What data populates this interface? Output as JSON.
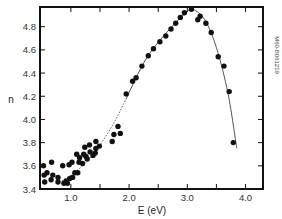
{
  "chart_data": {
    "type": "scatter",
    "title": "",
    "xlabel": "E (eV)",
    "ylabel": "n",
    "xlim": [
      0.47,
      4.3
    ],
    "ylim": [
      3.4,
      4.97
    ],
    "grid": false,
    "legend": null,
    "side_annotation": "M60-B061219",
    "x_ticks": [
      {
        "value": 1.0,
        "label": "1.0"
      },
      {
        "value": 1.5,
        "label": ""
      },
      {
        "value": 2.0,
        "label": "2.0"
      },
      {
        "value": 2.5,
        "label": ""
      },
      {
        "value": 3.0,
        "label": "3.0"
      },
      {
        "value": 3.5,
        "label": ""
      },
      {
        "value": 4.0,
        "label": "4.0"
      }
    ],
    "y_ticks": [
      {
        "value": 3.4,
        "label": "3.4"
      },
      {
        "value": 3.6,
        "label": "3.6"
      },
      {
        "value": 3.8,
        "label": "3.8"
      },
      {
        "value": 4.0,
        "label": "4.0"
      },
      {
        "value": 4.2,
        "label": "4.2"
      },
      {
        "value": 4.4,
        "label": "4.4"
      },
      {
        "value": 4.6,
        "label": "4.6"
      },
      {
        "value": 4.8,
        "label": "4.8"
      }
    ],
    "series": [
      {
        "name": "measured",
        "marker": "filled-circle",
        "color": "#111111",
        "points": [
          [
            0.53,
            3.6
          ],
          [
            0.67,
            3.63
          ],
          [
            0.54,
            3.52
          ],
          [
            0.59,
            3.54
          ],
          [
            0.69,
            3.52
          ],
          [
            0.78,
            3.5
          ],
          [
            0.86,
            3.6
          ],
          [
            0.97,
            3.61
          ],
          [
            1.02,
            3.63
          ],
          [
            1.1,
            3.7
          ],
          [
            1.22,
            3.7
          ],
          [
            1.24,
            3.76
          ],
          [
            0.55,
            3.46
          ],
          [
            0.66,
            3.48
          ],
          [
            0.78,
            3.46
          ],
          [
            0.88,
            3.45
          ],
          [
            0.94,
            3.45
          ],
          [
            0.98,
            3.49
          ],
          [
            1.03,
            3.5
          ],
          [
            1.12,
            3.54
          ],
          [
            1.14,
            3.63
          ],
          [
            1.15,
            3.67
          ],
          [
            1.2,
            3.62
          ],
          [
            1.26,
            3.68
          ],
          [
            1.33,
            3.72
          ],
          [
            1.38,
            3.69
          ],
          [
            1.43,
            3.75
          ],
          [
            1.32,
            3.78
          ],
          [
            1.49,
            3.77
          ],
          [
            1.43,
            3.81
          ],
          [
            1.71,
            3.81
          ],
          [
            1.74,
            3.87
          ],
          [
            1.81,
            3.94
          ],
          [
            1.85,
            3.88
          ],
          [
            1.42,
            3.71
          ],
          [
            1.07,
            3.54
          ],
          [
            0.92,
            3.47
          ],
          [
            1.28,
            3.66
          ],
          [
            1.95,
            4.22
          ],
          [
            2.06,
            4.33
          ],
          [
            2.12,
            4.36
          ],
          [
            2.22,
            4.46
          ],
          [
            2.33,
            4.55
          ],
          [
            2.42,
            4.61
          ],
          [
            2.53,
            4.67
          ],
          [
            2.63,
            4.72
          ],
          [
            2.72,
            4.78
          ],
          [
            2.8,
            4.83
          ],
          [
            2.88,
            4.88
          ],
          [
            2.95,
            4.92
          ],
          [
            3.07,
            4.95
          ],
          [
            3.18,
            4.86
          ],
          [
            3.22,
            4.89
          ],
          [
            3.32,
            4.83
          ],
          [
            3.41,
            4.75
          ],
          [
            3.53,
            4.54
          ],
          [
            3.63,
            4.46
          ],
          [
            3.72,
            4.24
          ],
          [
            3.79,
            3.8
          ]
        ]
      }
    ],
    "fit_curve": {
      "style": "dotted-then-solid",
      "dotted_points": [
        [
          0.85,
          3.47
        ],
        [
          1.2,
          3.6
        ],
        [
          1.5,
          3.78
        ],
        [
          1.75,
          3.98
        ],
        [
          1.95,
          4.18
        ]
      ],
      "solid_points": [
        [
          1.95,
          4.18
        ],
        [
          2.3,
          4.53
        ],
        [
          2.7,
          4.78
        ],
        [
          3.0,
          4.93
        ],
        [
          3.1,
          4.95
        ],
        [
          3.3,
          4.86
        ],
        [
          3.5,
          4.62
        ],
        [
          3.7,
          4.22
        ],
        [
          3.85,
          3.75
        ]
      ]
    }
  }
}
